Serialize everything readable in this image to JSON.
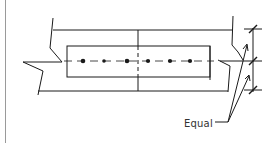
{
  "diagram": {
    "type": "bolted-splice-plate-detail",
    "annotation": {
      "label": "Equal"
    },
    "bolts": {
      "count": 6,
      "row": "single centered row"
    },
    "colors": {
      "line": "#1a1a1a",
      "border": "#9a9a9a",
      "background": "#ffffff"
    }
  }
}
